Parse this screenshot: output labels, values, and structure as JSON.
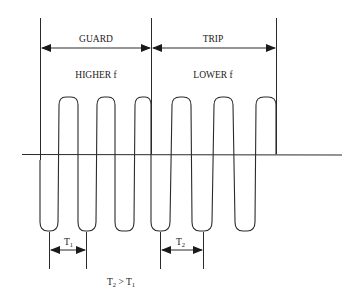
{
  "diagram": {
    "regions": [
      {
        "label": "GUARD",
        "sublabel": "HIGHER f",
        "x_start": 40,
        "x_end": 151
      },
      {
        "label": "TRIP",
        "sublabel": "LOWER f",
        "x_start": 151,
        "x_end": 276
      }
    ],
    "periods": [
      {
        "label_main": "T",
        "label_sub": "1",
        "x_start": 49,
        "x_end": 86
      },
      {
        "label_main": "T",
        "label_sub": "2",
        "x_start": 160,
        "x_end": 203
      }
    ],
    "relation": {
      "left_main": "T",
      "left_sub": "2",
      "operator": ">",
      "right_main": "T",
      "right_sub": "1"
    },
    "colors": {
      "ink": "#2a2a2a",
      "background": "#ffffff"
    }
  }
}
